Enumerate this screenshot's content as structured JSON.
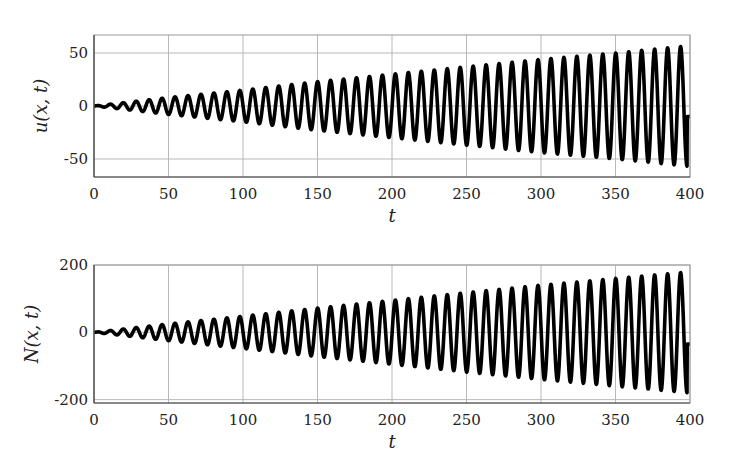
{
  "chart_data": [
    {
      "type": "line",
      "title": "",
      "xlabel": "t",
      "ylabel": "u(x, t)",
      "xlim": [
        0,
        400
      ],
      "ylim": [
        -67,
        67
      ],
      "xticks": [
        0,
        50,
        100,
        150,
        200,
        250,
        300,
        350,
        400
      ],
      "yticks": [
        -50,
        0,
        50
      ],
      "ytick_labels": [
        "-50",
        "0",
        "50"
      ],
      "grid": true,
      "legend": null,
      "series": [
        {
          "name": "u(x,t)",
          "color": "#000000",
          "description": "growing sinusoidal oscillation, period ~8.7, amplitude grows roughly linearly from ~0 to ~57",
          "period": 8.7,
          "amplitude_at": {
            "t": [
              0,
              50,
              100,
              150,
              200,
              250,
              300,
              350,
              400
            ],
            "amp": [
              0,
              8,
              15,
              23,
              30,
              37,
              44,
              50,
              57
            ]
          },
          "end_value": -10
        }
      ]
    },
    {
      "type": "line",
      "title": "",
      "xlabel": "t",
      "ylabel": "N(x, t)",
      "xlim": [
        0,
        400
      ],
      "ylim": [
        -210,
        200
      ],
      "xticks": [
        0,
        50,
        100,
        150,
        200,
        250,
        300,
        350,
        400
      ],
      "yticks": [
        -200,
        0,
        200
      ],
      "ytick_labels": [
        "-200",
        "0",
        "200"
      ],
      "grid": true,
      "legend": null,
      "series": [
        {
          "name": "N(x,t)",
          "color": "#000000",
          "description": "growing sinusoidal oscillation, period ~8.7, amplitude grows roughly linearly from ~0 to ~180",
          "period": 8.7,
          "amplitude_at": {
            "t": [
              0,
              50,
              100,
              150,
              200,
              250,
              300,
              350,
              400
            ],
            "amp": [
              0,
              25,
              48,
              72,
              95,
              118,
              140,
              160,
              180
            ]
          },
          "end_value": -35
        }
      ]
    }
  ],
  "panels": [
    {
      "ylabel": "u(x, t)",
      "xlabel": "t"
    },
    {
      "ylabel": "N(x, t)",
      "xlabel": "t"
    }
  ]
}
